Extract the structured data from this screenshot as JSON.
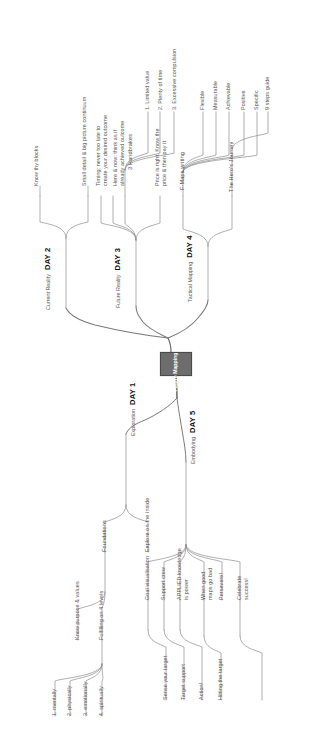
{
  "diagram": {
    "center_node": {
      "label": "Future\nMapping",
      "color": "#6d6d6d",
      "text_color": "#ffffff"
    },
    "orientation": "rotated-90",
    "line_color": "#8c8c8c",
    "branches": [
      {
        "id": "day1",
        "day": "DAY 1",
        "subtitle": "Exploration",
        "children": [
          {
            "label": "Foundations",
            "children": [
              {
                "label": "Know purpose & values"
              },
              {
                "label": "Fulfilling on 4 levels",
                "children": [
                  {
                    "label": "1. mentally"
                  },
                  {
                    "label": "2. physically"
                  },
                  {
                    "label": "3. emotionally"
                  },
                  {
                    "label": "4. spiritually"
                  }
                ]
              }
            ]
          },
          {
            "label": "Explore on the inside"
          }
        ]
      },
      {
        "id": "day2",
        "day": "DAY 2",
        "subtitle": "Current Reality",
        "children": [
          {
            "label": "Know thy blocks"
          },
          {
            "label": "Small detail & big picture continuum"
          }
        ]
      },
      {
        "id": "day3",
        "day": "DAY 3",
        "subtitle": "Future Reality",
        "children": [
          {
            "label": "Timing: never too late to create your desired outcome"
          },
          {
            "label": "Here & now: think as if already achieved outcome"
          },
          {
            "label": "3 Handbrakes",
            "children": [
              {
                "label": "1. Limited value"
              },
              {
                "label": "2. Plenty of time"
              },
              {
                "label": "3. Excessive compulsion"
              }
            ]
          },
          {
            "label": "Price is right: Know the price & then pay it"
          }
        ]
      },
      {
        "id": "day4",
        "day": "DAY 4",
        "subtitle": "Tactical Mapping",
        "children": [
          {
            "label": "F-Maps writing",
            "children": [
              {
                "label": "Flexible"
              },
              {
                "label": "Measurable"
              },
              {
                "label": "Achievable"
              },
              {
                "label": "Positive"
              },
              {
                "label": "Specific"
              }
            ]
          },
          {
            "label": "The Hero's Journey",
            "children": [
              {
                "label": "9 steps guide"
              }
            ]
          }
        ]
      },
      {
        "id": "day5",
        "day": "DAY 5",
        "subtitle": "Embodying",
        "children": [
          {
            "label": "Goal visualisation",
            "children": [
              {
                "label": "Sense your target"
              }
            ]
          },
          {
            "label": "Support crew",
            "children": [
              {
                "label": "Target support"
              }
            ]
          },
          {
            "label": "APPLIED knowledge is power",
            "children": [
              {
                "label": "Action!"
              }
            ]
          },
          {
            "label": "When good maps go bad"
          },
          {
            "label": "Persevere!"
          },
          {
            "label": "Celebrate success!",
            "children": [
              {
                "label": "Hitting the target"
              }
            ]
          }
        ]
      }
    ]
  },
  "labels": {
    "know_thy_blocks": "Know thy blocks",
    "small_detail": "Small detail & big picture continuum",
    "timing": "Timing: never too late to",
    "timing2": "create your desired outcome",
    "here_now": "Here & now: think as if",
    "here_now2": "already achieved outcome",
    "handbrakes": "3 Handbrakes",
    "hb1": "1. Limited value",
    "hb2": "2. Plenty of time",
    "hb3": "3. Excessive compulsion",
    "price": "Price is right: Know the",
    "price2": "price & then pay it",
    "fmaps": "F-Maps writing",
    "flexible": "Flexible",
    "measurable": "Measurable",
    "achievable": "Achievable",
    "positive": "Positive",
    "specific": "Specific",
    "hero": "The Hero's Journey",
    "steps9": "9 steps guide",
    "current_reality": "Current Reality",
    "day2": "DAY 2",
    "future_reality": "Future Reality",
    "day3": "DAY 3",
    "tactical": "Tactical Mapping",
    "day4": "DAY 4",
    "exploration": "Exploration",
    "day1": "DAY 1",
    "embodying": "Embodying",
    "day5": "DAY 5",
    "foundations": "Foundations",
    "explore_inside": "Explore on the inside",
    "know_purpose": "Know purpose & values",
    "fulfilling": "Fulfilling on 4 levels",
    "l1": "1. mentally",
    "l2": "2. physically",
    "l3": "3. emotionally",
    "l4": "4. spiritually",
    "goal_vis": "Goal visualisation",
    "sense_target": "Sense your target",
    "support_crew": "Support crew",
    "target_support": "Target support",
    "applied1": "APPLIED knowledge",
    "applied2": "is power",
    "action": "Action!",
    "whengood1": "When good",
    "whengood2": "maps go bad",
    "persevere": "Persevere!",
    "celebrate1": "Celebrate",
    "celebrate2": "success!",
    "hitting": "Hitting the target",
    "center1": "Future",
    "center2": "Mapping"
  }
}
